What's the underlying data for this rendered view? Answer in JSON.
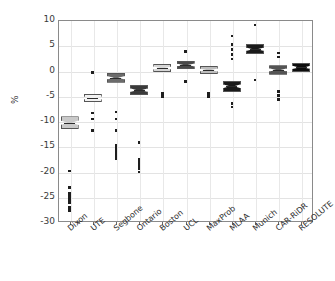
{
  "chart_data": {
    "type": "box",
    "title": "",
    "xlabel": "",
    "ylabel": "%",
    "ylim": [
      -30,
      10
    ],
    "ytick_values": [
      10,
      5,
      0,
      -5,
      -10,
      -15,
      -20,
      -25,
      -30
    ],
    "ytick_labels": [
      "10",
      "5",
      "0",
      "-5",
      "-10",
      "-15",
      "-20",
      "-25",
      "-30"
    ],
    "grid": true,
    "legend": "none",
    "notched": true,
    "categories": [
      "Dixon",
      "UTE",
      "Segbone",
      "Ontario",
      "Boston",
      "UCL",
      "MaxProb",
      "MLAA",
      "Munich",
      "CAR-RiDR",
      "RESOLUTE"
    ],
    "boxes": [
      {
        "name": "Dixon",
        "color": "#c9c9c9",
        "q1": -11.6,
        "median": -10.4,
        "q3": -9.1,
        "outliers": [
          -19.9,
          -23.2,
          -24.3,
          -25.0,
          -25.4,
          -25.8,
          -26.2,
          -27.0,
          -27.4,
          -27.8
        ]
      },
      {
        "name": "UTE",
        "color": "#f2f2f2",
        "q1": -6.3,
        "median": -5.4,
        "q3": -4.6,
        "outliers": [
          -0.4,
          -8.4,
          -9.6,
          -11.9
        ]
      },
      {
        "name": "Segbone",
        "color": "#6b6b6b",
        "q1": -2.4,
        "median": -1.4,
        "q3": -0.5,
        "outliers": [
          -8.2,
          -9.6,
          -11.9,
          -14.8,
          -15.3,
          -15.8,
          -16.3,
          -16.7,
          -17.0,
          -17.4
        ]
      },
      {
        "name": "Ontario",
        "color": "#3a3a3a",
        "q1": -4.9,
        "median": -3.9,
        "q3": -2.9,
        "outliers": [
          -14.2,
          -17.6,
          -18.2,
          -18.6,
          -19.0,
          -19.5,
          -20.1
        ]
      },
      {
        "name": "Boston",
        "color": "#d6d6d6",
        "q1": -0.3,
        "median": 0.5,
        "q3": 1.3,
        "outliers": [
          -4.6,
          -5.1
        ]
      },
      {
        "name": "UCL",
        "color": "#4a4a4a",
        "q1": 0.3,
        "median": 1.1,
        "q3": 1.9,
        "outliers": [
          3.8,
          -2.2
        ]
      },
      {
        "name": "MaxProb",
        "color": "#bdbdbd",
        "q1": -0.7,
        "median": 0.1,
        "q3": 0.9,
        "outliers": [
          -4.5,
          -5.2
        ]
      },
      {
        "name": "MLAA",
        "color": "#1a1a1a",
        "q1": -4.2,
        "median": -3.1,
        "q3": -2.0,
        "outliers": [
          6.8,
          5.2,
          4.2,
          3.2,
          2.3,
          -6.5,
          -7.2
        ]
      },
      {
        "name": "Munich",
        "color": "#1a1a1a",
        "q1": 3.2,
        "median": 4.2,
        "q3": 5.2,
        "outliers": [
          9.0,
          -1.9
        ]
      },
      {
        "name": "CAR-RiDR",
        "color": "#545454",
        "q1": -0.8,
        "median": 0.1,
        "q3": 1.0,
        "outliers": [
          3.5,
          2.7,
          -4.2,
          -5.0,
          -5.7
        ]
      },
      {
        "name": "RESOLUTE",
        "color": "#0d0d0d",
        "q1": -0.3,
        "median": 0.6,
        "q3": 1.5,
        "outliers": []
      }
    ]
  }
}
